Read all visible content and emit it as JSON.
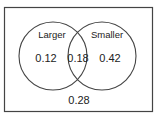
{
  "diagram": {
    "type": "venn",
    "sets": [
      {
        "label": "Larger",
        "only_value": "0.12"
      },
      {
        "label": "Smaller",
        "only_value": "0.42"
      }
    ],
    "intersection_value": "0.18",
    "outside_value": "0.28",
    "colors": {
      "stroke": "#444444",
      "background": "#ffffff",
      "text": "#222222"
    }
  }
}
